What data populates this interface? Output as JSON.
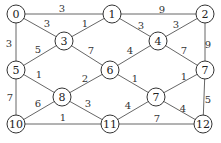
{
  "graph": {
    "nodes": [
      {
        "id": "n0",
        "label": "0",
        "x": 16,
        "y": 14
      },
      {
        "id": "n1",
        "label": "1",
        "x": 112,
        "y": 14
      },
      {
        "id": "n2",
        "label": "2",
        "x": 205,
        "y": 14
      },
      {
        "id": "n3",
        "label": "3",
        "x": 64,
        "y": 41
      },
      {
        "id": "n4",
        "label": "4",
        "x": 158,
        "y": 41
      },
      {
        "id": "n5",
        "label": "5",
        "x": 16,
        "y": 70
      },
      {
        "id": "n6",
        "label": "6",
        "x": 110,
        "y": 70
      },
      {
        "id": "n7r",
        "label": "7",
        "x": 205,
        "y": 70
      },
      {
        "id": "n8",
        "label": "8",
        "x": 62,
        "y": 97
      },
      {
        "id": "n7m",
        "label": "7",
        "x": 156,
        "y": 97
      },
      {
        "id": "n10",
        "label": "10",
        "x": 16,
        "y": 124
      },
      {
        "id": "n11",
        "label": "11",
        "x": 110,
        "y": 124
      },
      {
        "id": "n12",
        "label": "12",
        "x": 203,
        "y": 124
      }
    ],
    "edges": [
      {
        "from": "n0",
        "to": "n1",
        "weight": "3",
        "lx": 62,
        "ly": 8
      },
      {
        "from": "n0",
        "to": "n3",
        "weight": "3",
        "lx": 47,
        "ly": 23
      },
      {
        "from": "n0",
        "to": "n5",
        "weight": "3",
        "lx": 9,
        "ly": 43
      },
      {
        "from": "n1",
        "to": "n3",
        "weight": "1",
        "lx": 85,
        "ly": 23
      },
      {
        "from": "n1",
        "to": "n2",
        "weight": "9",
        "lx": 162,
        "ly": 9
      },
      {
        "from": "n1",
        "to": "n4",
        "weight": "3",
        "lx": 141,
        "ly": 25
      },
      {
        "from": "n2",
        "to": "n4",
        "weight": "3",
        "lx": 176,
        "ly": 24
      },
      {
        "from": "n2",
        "to": "n7r",
        "weight": "9",
        "lx": 208,
        "ly": 44
      },
      {
        "from": "n3",
        "to": "n5",
        "weight": "5",
        "lx": 38,
        "ly": 49
      },
      {
        "from": "n3",
        "to": "n6",
        "weight": "7",
        "lx": 91,
        "ly": 50
      },
      {
        "from": "n4",
        "to": "n6",
        "weight": "4",
        "lx": 130,
        "ly": 50
      },
      {
        "from": "n4",
        "to": "n7r",
        "weight": "7",
        "lx": 184,
        "ly": 50
      },
      {
        "from": "n5",
        "to": "n8",
        "weight": "1",
        "lx": 39,
        "ly": 74
      },
      {
        "from": "n5",
        "to": "n10",
        "weight": "7",
        "lx": 10,
        "ly": 97
      },
      {
        "from": "n6",
        "to": "n8",
        "weight": "2",
        "lx": 85,
        "ly": 78
      },
      {
        "from": "n6",
        "to": "n7m",
        "weight": "1",
        "lx": 135,
        "ly": 78
      },
      {
        "from": "n7m",
        "to": "n7r",
        "weight": "1",
        "lx": 184,
        "ly": 76
      },
      {
        "from": "n7r",
        "to": "n12",
        "weight": "5",
        "lx": 208,
        "ly": 99
      },
      {
        "from": "n8",
        "to": "n10",
        "weight": "6",
        "lx": 38,
        "ly": 103
      },
      {
        "from": "n8",
        "to": "n11",
        "weight": "3",
        "lx": 88,
        "ly": 103
      },
      {
        "from": "n10",
        "to": "n11",
        "weight": "1",
        "lx": 63,
        "ly": 117
      },
      {
        "from": "n11",
        "to": "n7m",
        "weight": "4",
        "lx": 128,
        "ly": 105
      },
      {
        "from": "n7m",
        "to": "n12",
        "weight": "4",
        "lx": 183,
        "ly": 108
      },
      {
        "from": "n11",
        "to": "n12",
        "weight": "7",
        "lx": 157,
        "ly": 118
      }
    ],
    "node_radius": 9
  }
}
